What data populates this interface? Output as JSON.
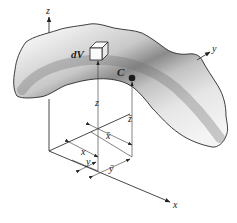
{
  "figure": {
    "labels": {
      "z_axis": "z",
      "y_axis": "y",
      "x_axis": "x",
      "dV": "dV",
      "centroid": "C",
      "z_element": "z",
      "z_bar": "z̄",
      "x_element": "x",
      "x_bar": "x̄",
      "y_element": "y",
      "y_bar": "ȳ"
    },
    "colors": {
      "body_light": "#f2f2f2",
      "body_mid": "#bdbdbd",
      "body_dark": "#7a7a7a",
      "outline": "#2a2a2a",
      "line": "#333333",
      "centroid_dot": "#1a1a1a"
    }
  }
}
